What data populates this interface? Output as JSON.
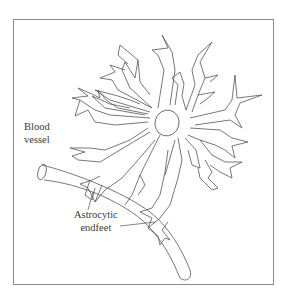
{
  "figure": {
    "type": "line-art diagram",
    "labels": {
      "blood_vessel_line1": "Blood",
      "blood_vessel_line2": "vessel",
      "endfeet_line1": "Astrocytic",
      "endfeet_line2": "endfeet"
    },
    "colors": {
      "line": "#555555",
      "frame": "#8a8a8a",
      "text": "#3a3a3a",
      "background": "#ffffff"
    }
  }
}
